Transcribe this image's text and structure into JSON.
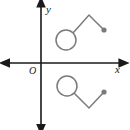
{
  "figure": {
    "background_color": "#ffffff",
    "axis_color": "#1a1a1a",
    "shape_color": "#7a7a7a",
    "labels": {
      "x_axis": "x",
      "y_axis": "y",
      "origin": "O"
    },
    "axes": {
      "x": {
        "x1": 8,
        "y1": 63,
        "x2": 122,
        "y2": 63,
        "arrows": "both"
      },
      "y": {
        "x1": 41,
        "y1": 126,
        "x2": 41,
        "y2": 4,
        "arrows": "both"
      },
      "origin_point": {
        "x": 41,
        "y": 63
      }
    },
    "label_positions": {
      "x": {
        "x": 115,
        "y": 73
      },
      "y": {
        "x": 46,
        "y": 13
      },
      "origin": {
        "x": 29,
        "y": 74
      }
    },
    "shapes": [
      {
        "name": "upper-shape",
        "quadrant": "I",
        "description": "open circle joined to a zigzag polyline rising to a peak then falling to a solid dot",
        "circle": {
          "cx": 66,
          "cy": 40,
          "r": 10,
          "fill": "none"
        },
        "polyline": [
          {
            "x": 73,
            "y": 33
          },
          {
            "x": 89,
            "y": 15
          },
          {
            "x": 104,
            "y": 30
          }
        ],
        "endpoint_dot": {
          "cx": 104,
          "cy": 30,
          "r": 2.6,
          "fill": "#7a7a7a"
        }
      },
      {
        "name": "lower-shape",
        "quadrant": "IV",
        "description": "open circle joined to a zigzag polyline falling to a valley then rising to a solid dot",
        "circle": {
          "cx": 67,
          "cy": 86,
          "r": 10,
          "fill": "none"
        },
        "polyline": [
          {
            "x": 74,
            "y": 93
          },
          {
            "x": 89,
            "y": 108
          },
          {
            "x": 104,
            "y": 92
          }
        ],
        "endpoint_dot": {
          "cx": 104,
          "cy": 92,
          "r": 2.6,
          "fill": "#7a7a7a"
        }
      }
    ]
  }
}
